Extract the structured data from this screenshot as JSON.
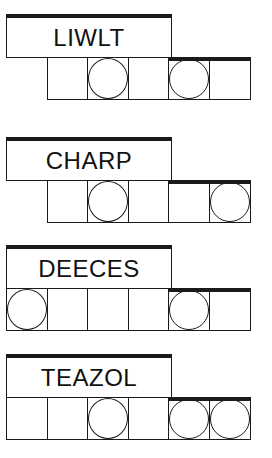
{
  "puzzles": [
    {
      "word": "LIWLT",
      "top": 14,
      "cell_start": 1,
      "cells": [
        false,
        true,
        false,
        true,
        false
      ]
    },
    {
      "word": "CHARP",
      "top": 137,
      "cell_start": 1,
      "cells": [
        false,
        true,
        false,
        false,
        true
      ]
    },
    {
      "word": "DEECES",
      "top": 245,
      "cell_start": 0,
      "cells": [
        true,
        false,
        false,
        false,
        true,
        false
      ]
    },
    {
      "word": "TEAZOL",
      "top": 354,
      "cell_start": 0,
      "cells": [
        false,
        false,
        true,
        false,
        true,
        true
      ]
    }
  ]
}
